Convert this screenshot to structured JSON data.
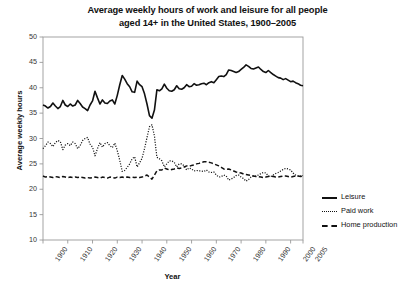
{
  "chart_data": {
    "type": "line",
    "title": "Average weekly hours of work and leisure for all people aged 14+ in the United States, 1900–2005",
    "title_line1": "Average weekly hours of work and leisure for all people",
    "title_line2": "aged 14+ in the United States, 1900–2005",
    "xlabel": "Year",
    "ylabel": "Average weekly hours",
    "xlim": [
      1900,
      2005
    ],
    "ylim": [
      10,
      50
    ],
    "yticks": [
      10,
      15,
      20,
      25,
      30,
      35,
      40,
      45,
      50
    ],
    "xticks": [
      1900,
      1910,
      1920,
      1930,
      1940,
      1950,
      1960,
      1970,
      1980,
      1990,
      2000,
      2005
    ],
    "xtick_labels": [
      "1900",
      "1910",
      "1920",
      "1930",
      "1940",
      "1950",
      "1960",
      "1970",
      "1980",
      "1990",
      "2000",
      "2005"
    ],
    "grid": false,
    "legend_position": "right",
    "series": [
      {
        "name": "Leisure",
        "style": "solid",
        "color": "#111111",
        "x": [
          1900,
          1901,
          1902,
          1903,
          1904,
          1905,
          1906,
          1907,
          1908,
          1909,
          1910,
          1911,
          1912,
          1913,
          1914,
          1915,
          1916,
          1917,
          1918,
          1919,
          1920,
          1921,
          1922,
          1923,
          1924,
          1925,
          1926,
          1927,
          1928,
          1929,
          1930,
          1931,
          1932,
          1933,
          1934,
          1935,
          1936,
          1937,
          1938,
          1939,
          1940,
          1941,
          1942,
          1943,
          1944,
          1945,
          1946,
          1947,
          1948,
          1949,
          1950,
          1951,
          1952,
          1953,
          1954,
          1955,
          1956,
          1957,
          1958,
          1959,
          1960,
          1961,
          1962,
          1963,
          1964,
          1965,
          1966,
          1967,
          1968,
          1969,
          1970,
          1971,
          1972,
          1973,
          1974,
          1975,
          1976,
          1977,
          1978,
          1979,
          1980,
          1981,
          1982,
          1983,
          1984,
          1985,
          1986,
          1987,
          1988,
          1989,
          1990,
          1991,
          1992,
          1993,
          1994,
          1995,
          1996,
          1997,
          1998,
          1999,
          2000,
          2001,
          2002,
          2003,
          2004,
          2005
        ],
        "values": [
          36.6,
          36.4,
          36.0,
          36.3,
          37.0,
          36.4,
          35.9,
          36.3,
          37.5,
          36.6,
          36.3,
          36.8,
          36.4,
          36.6,
          37.5,
          36.9,
          36.2,
          35.9,
          35.5,
          36.6,
          37.4,
          39.3,
          38.0,
          36.8,
          37.6,
          37.0,
          36.9,
          37.4,
          37.6,
          36.8,
          38.5,
          40.6,
          42.4,
          41.7,
          40.8,
          40.2,
          39.2,
          39.1,
          41.3,
          40.6,
          40.2,
          38.8,
          36.8,
          34.5,
          34.0,
          35.6,
          39.6,
          39.4,
          39.8,
          40.7,
          39.9,
          39.4,
          39.3,
          39.6,
          40.4,
          39.8,
          39.7,
          40.0,
          40.6,
          40.2,
          40.3,
          40.8,
          40.5,
          40.6,
          40.8,
          40.9,
          40.6,
          41.0,
          41.2,
          41.0,
          41.6,
          42.2,
          42.3,
          42.2,
          42.6,
          43.5,
          43.4,
          43.2,
          43.0,
          43.2,
          43.6,
          44.0,
          44.5,
          44.2,
          43.8,
          43.7,
          43.9,
          44.1,
          43.6,
          43.2,
          43.0,
          43.4,
          43.0,
          42.6,
          42.3,
          42.0,
          41.9,
          41.6,
          41.8,
          41.5,
          41.2,
          41.3,
          41.0,
          40.8,
          40.5,
          40.4
        ]
      },
      {
        "name": "Paid work",
        "style": "dotted",
        "color": "#111111",
        "x": [
          1900,
          1901,
          1902,
          1903,
          1904,
          1905,
          1906,
          1907,
          1908,
          1909,
          1910,
          1911,
          1912,
          1913,
          1914,
          1915,
          1916,
          1917,
          1918,
          1919,
          1920,
          1921,
          1922,
          1923,
          1924,
          1925,
          1926,
          1927,
          1928,
          1929,
          1930,
          1931,
          1932,
          1933,
          1934,
          1935,
          1936,
          1937,
          1938,
          1939,
          1940,
          1941,
          1942,
          1943,
          1944,
          1945,
          1946,
          1947,
          1948,
          1949,
          1950,
          1951,
          1952,
          1953,
          1954,
          1955,
          1956,
          1957,
          1958,
          1959,
          1960,
          1961,
          1962,
          1963,
          1964,
          1965,
          1966,
          1967,
          1968,
          1969,
          1970,
          1971,
          1972,
          1973,
          1974,
          1975,
          1976,
          1977,
          1978,
          1979,
          1980,
          1981,
          1982,
          1983,
          1984,
          1985,
          1986,
          1987,
          1988,
          1989,
          1990,
          1991,
          1992,
          1993,
          1994,
          1995,
          1996,
          1997,
          1998,
          1999,
          2000,
          2001,
          2002,
          2003,
          2004,
          2005
        ],
        "values": [
          28.0,
          28.6,
          29.3,
          29.0,
          28.4,
          29.2,
          29.6,
          29.4,
          27.8,
          28.7,
          29.0,
          28.6,
          29.3,
          29.0,
          28.0,
          28.6,
          29.6,
          30.0,
          30.2,
          28.9,
          28.3,
          26.6,
          28.0,
          29.2,
          28.3,
          29.0,
          29.2,
          28.6,
          28.2,
          29.1,
          27.6,
          25.7,
          23.5,
          23.7,
          24.3,
          25.0,
          26.0,
          26.4,
          24.4,
          25.2,
          26.1,
          28.0,
          30.2,
          32.3,
          32.7,
          30.5,
          26.3,
          26.0,
          25.6,
          24.4,
          25.0,
          25.6,
          25.6,
          25.3,
          24.4,
          25.0,
          25.0,
          24.6,
          23.8,
          24.2,
          24.0,
          23.6,
          23.7,
          23.6,
          23.6,
          23.5,
          23.8,
          23.4,
          23.3,
          23.4,
          22.8,
          22.4,
          22.5,
          22.8,
          22.6,
          21.8,
          22.0,
          22.3,
          22.7,
          22.8,
          22.4,
          22.1,
          21.6,
          21.9,
          22.4,
          22.6,
          22.6,
          22.8,
          23.1,
          23.3,
          23.2,
          22.6,
          22.5,
          22.8,
          23.1,
          23.3,
          23.6,
          23.9,
          24.1,
          24.0,
          23.8,
          23.2,
          22.8,
          22.6,
          22.6,
          22.7
        ]
      },
      {
        "name": "Home production",
        "style": "dashed",
        "color": "#111111",
        "x": [
          1900,
          1901,
          1902,
          1903,
          1904,
          1905,
          1906,
          1907,
          1908,
          1909,
          1910,
          1911,
          1912,
          1913,
          1914,
          1915,
          1916,
          1917,
          1918,
          1919,
          1920,
          1921,
          1922,
          1923,
          1924,
          1925,
          1926,
          1927,
          1928,
          1929,
          1930,
          1931,
          1932,
          1933,
          1934,
          1935,
          1936,
          1937,
          1938,
          1939,
          1940,
          1941,
          1942,
          1943,
          1944,
          1945,
          1946,
          1947,
          1948,
          1949,
          1950,
          1951,
          1952,
          1953,
          1954,
          1955,
          1956,
          1957,
          1958,
          1959,
          1960,
          1961,
          1962,
          1963,
          1964,
          1965,
          1966,
          1967,
          1968,
          1969,
          1970,
          1971,
          1972,
          1973,
          1974,
          1975,
          1976,
          1977,
          1978,
          1979,
          1980,
          1981,
          1982,
          1983,
          1984,
          1985,
          1986,
          1987,
          1988,
          1989,
          1990,
          1991,
          1992,
          1993,
          1994,
          1995,
          1996,
          1997,
          1998,
          1999,
          2000,
          2001,
          2002,
          2003,
          2004,
          2005
        ],
        "values": [
          22.6,
          22.4,
          22.5,
          22.4,
          22.3,
          22.5,
          22.4,
          22.3,
          22.5,
          22.4,
          22.3,
          22.4,
          22.3,
          22.4,
          22.3,
          22.4,
          22.3,
          22.2,
          22.3,
          22.2,
          22.3,
          22.4,
          22.3,
          22.2,
          22.4,
          22.3,
          22.2,
          22.4,
          22.3,
          22.2,
          22.4,
          22.3,
          22.4,
          22.3,
          22.4,
          22.3,
          22.4,
          22.3,
          22.4,
          22.3,
          22.4,
          22.6,
          22.8,
          22.4,
          22.0,
          22.8,
          23.6,
          23.8,
          23.8,
          24.2,
          24.0,
          23.8,
          23.9,
          24.0,
          24.2,
          24.1,
          24.2,
          24.4,
          24.6,
          24.5,
          24.7,
          24.8,
          25.0,
          25.1,
          25.3,
          25.4,
          25.4,
          25.3,
          25.2,
          25.0,
          24.8,
          24.6,
          24.3,
          24.0,
          23.9,
          24.0,
          23.8,
          23.6,
          23.4,
          23.3,
          23.2,
          23.0,
          22.9,
          22.8,
          22.7,
          22.6,
          22.5,
          22.5,
          22.4,
          22.3,
          22.4,
          22.5,
          22.6,
          22.5,
          22.4,
          22.4,
          22.5,
          22.6,
          22.6,
          22.5,
          22.4,
          22.5,
          22.6,
          22.6,
          22.5,
          22.6
        ]
      }
    ]
  },
  "legend": {
    "items": [
      {
        "label": "Leisure",
        "style": "solid"
      },
      {
        "label": "Paid work",
        "style": "dotted"
      },
      {
        "label": "Home production",
        "style": "dashed"
      }
    ]
  }
}
